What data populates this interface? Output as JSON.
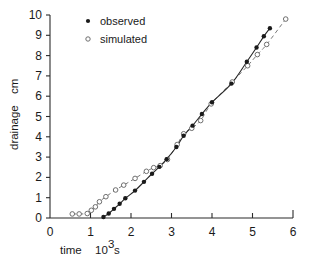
{
  "chart_data": {
    "type": "line",
    "title": "",
    "subtitle": "",
    "xlabel": "time  10³ s",
    "xlabel_parts": {
      "name": "time",
      "mantissa": "10",
      "exponent": "3",
      "unit": "s"
    },
    "ylabel": "drainage  cm",
    "ylabel_parts": {
      "name": "drainage",
      "unit": "cm"
    },
    "xlim": [
      0,
      6
    ],
    "ylim": [
      0,
      10
    ],
    "xticks": [
      0,
      1,
      2,
      3,
      4,
      5,
      6
    ],
    "xtick_labels": [
      "0",
      "1",
      "2",
      "3",
      "4",
      "5",
      "6"
    ],
    "yticks": [
      0,
      1,
      2,
      3,
      4,
      5,
      6,
      7,
      8,
      9,
      10
    ],
    "ytick_labels": [
      "0",
      "1",
      "2",
      "3",
      "4",
      "5",
      "6",
      "7",
      "8",
      "9",
      "10"
    ],
    "grid": false,
    "legend_position": "top-center",
    "series": [
      {
        "name": "observed",
        "marker": "filled-circle",
        "line_style": "solid",
        "color": "#1a1a1a",
        "x": [
          1.32,
          1.45,
          1.58,
          1.72,
          1.86,
          2.1,
          2.32,
          2.52,
          2.7,
          2.88,
          3.12,
          3.3,
          3.52,
          3.75,
          4.0,
          4.48,
          4.86,
          5.1,
          5.28,
          5.43
        ],
        "y": [
          0.05,
          0.22,
          0.45,
          0.7,
          0.97,
          1.35,
          1.78,
          2.18,
          2.52,
          2.9,
          3.5,
          4.05,
          4.55,
          5.12,
          5.7,
          6.62,
          7.7,
          8.4,
          8.95,
          9.35
        ]
      },
      {
        "name": "simulated",
        "marker": "open-circle",
        "line_style": "dashed",
        "color": "#7a7a7a",
        "x": [
          0.55,
          0.72,
          0.92,
          1.02,
          1.12,
          1.22,
          1.38,
          1.62,
          1.82,
          2.1,
          2.38,
          2.56,
          2.72,
          2.9,
          3.14,
          3.3,
          3.5,
          3.72,
          3.98,
          4.5,
          4.88,
          5.12,
          5.35,
          5.82
        ],
        "y": [
          0.2,
          0.2,
          0.22,
          0.38,
          0.55,
          0.8,
          1.05,
          1.38,
          1.62,
          1.95,
          2.3,
          2.48,
          2.58,
          2.88,
          3.62,
          4.15,
          4.42,
          4.8,
          5.62,
          6.7,
          7.5,
          8.05,
          8.55,
          9.8
        ]
      }
    ],
    "legend": [
      {
        "label": "observed",
        "marker": "filled-circle"
      },
      {
        "label": "simulated",
        "marker": "open-circle"
      }
    ]
  },
  "colors": {
    "observed": "#1a1a1a",
    "simulated": "#7a7a7a",
    "axis": "#2b2b2b",
    "background": "#ffffff"
  }
}
